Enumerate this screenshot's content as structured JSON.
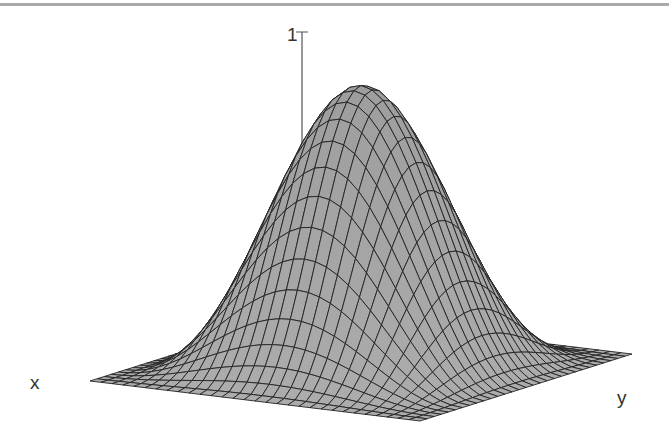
{
  "chart_data": {
    "type": "surface",
    "title": "",
    "function": "z = sin(pi*u)^2 * sin(pi*v)^2",
    "xlabel": "x",
    "ylabel": "y",
    "zlabel": "",
    "z_tick_labels": [
      "1"
    ],
    "zlim": [
      0,
      1
    ],
    "grid_divisions": 30,
    "peak_value": 1,
    "surface_color": "#a6a6a6",
    "mesh_color": "#222222",
    "projection": {
      "left_corner": [
        90,
        381
      ],
      "front_corner": [
        420,
        421
      ],
      "right_corner": [
        632,
        354
      ],
      "z_unit_px": 282
    }
  },
  "axes": {
    "x_label": "x",
    "y_label": "y",
    "z_tick": "1"
  }
}
